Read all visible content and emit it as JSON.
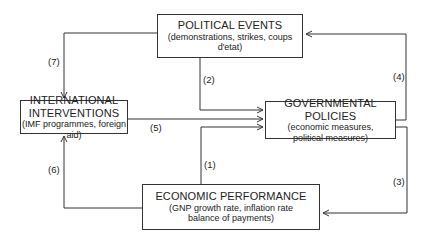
{
  "nodes": {
    "political": {
      "title": "POLITICAL EVENTS",
      "subtitle": "(demonstrations, strikes, coups d'etat)"
    },
    "international": {
      "title_line1": "INTERNATIONAL",
      "title_line2": "INTERVENTIONS",
      "subtitle": "(IMF programmes, foreign aid)"
    },
    "governmental": {
      "title": "GOVERNMENTAL POLICIES",
      "subtitle_line1": "(economic measures,",
      "subtitle_line2": "political measures)"
    },
    "economic": {
      "title": "ECONOMIC PERFORMANCE",
      "subtitle_line1": "(GNP growth rate, inflation rate",
      "subtitle_line2": "balance of payments)"
    }
  },
  "edges": [
    {
      "label": "(1)",
      "from": "economic",
      "to": "governmental"
    },
    {
      "label": "(2)",
      "from": "political",
      "to": "governmental"
    },
    {
      "label": "(3)",
      "from": "governmental",
      "to": "economic"
    },
    {
      "label": "(4)",
      "from": "governmental",
      "to": "political"
    },
    {
      "label": "(5)",
      "from": "international",
      "to": "governmental"
    },
    {
      "label": "(6)",
      "from": "economic",
      "to": "international"
    },
    {
      "label": "(7)",
      "from": "political",
      "to": "international"
    }
  ]
}
